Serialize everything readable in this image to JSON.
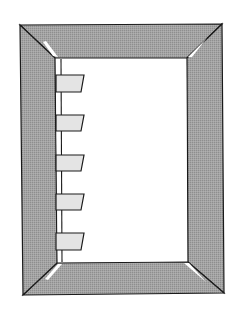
{
  "diagram": {
    "colors": {
      "background": "#ffffff",
      "frame": "#9e9e9e",
      "frame_stroke": "#1a1a1a",
      "inner_page": "#ffffff",
      "tab_fill": "#e4e4e4",
      "highlight": "#ffffff"
    },
    "outer": {
      "tl": [
        20,
        25
      ],
      "tr": [
        222,
        24
      ],
      "br": [
        224,
        293
      ],
      "bl": [
        23,
        295
      ]
    },
    "inner": {
      "tl": [
        55,
        58
      ],
      "tr": [
        187,
        58
      ],
      "br": [
        188,
        262
      ],
      "bl": [
        57,
        263
      ]
    },
    "page_edge_x": 61,
    "tabs": [
      {
        "top": 75,
        "bottom": 92
      },
      {
        "top": 115,
        "bottom": 131
      },
      {
        "top": 155,
        "bottom": 171
      },
      {
        "top": 194,
        "bottom": 210
      },
      {
        "top": 233,
        "bottom": 250
      }
    ],
    "tab_shape": {
      "left": 56,
      "right_top": 84,
      "right_bottom": 81
    }
  }
}
